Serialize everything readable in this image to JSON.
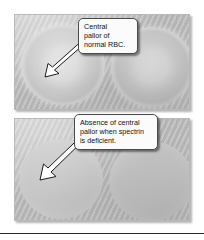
{
  "figure": {
    "name": "red-blood-cell-spectrin-comparison",
    "panels": [
      {
        "id": "panel-top",
        "name": "normal-rbc-panel",
        "cells": [
          {
            "name": "normal-rbc-left",
            "type": "normal",
            "feature": "central pallor present"
          },
          {
            "name": "normal-rbc-right",
            "type": "normal",
            "feature": "central pallor present"
          }
        ]
      },
      {
        "id": "panel-bottom",
        "name": "spectrin-deficient-rbc-panel",
        "cells": [
          {
            "name": "spherocyte-left",
            "type": "spherocyte",
            "feature": "no central pallor"
          },
          {
            "name": "spherocyte-right",
            "type": "spherocyte",
            "feature": "no central pallor"
          }
        ]
      }
    ]
  },
  "callouts": {
    "normal": {
      "text": "Central\npallor of\nnormal RBC.",
      "points_to": "normal-rbc-left"
    },
    "deficient": {
      "text": "Absence of central\npallor when spectrin\nis deficient.",
      "points_to": "spherocyte-left"
    }
  },
  "colors": {
    "panel_background": "#c3c3c3",
    "callout_background": "#fbfbfb",
    "callout_border": "#4a4a4a",
    "arrow_fill": "#ffffff",
    "arrow_stroke": "#1a1a1a",
    "rule": "#2b2b2b",
    "page_background": "#ffffff"
  }
}
